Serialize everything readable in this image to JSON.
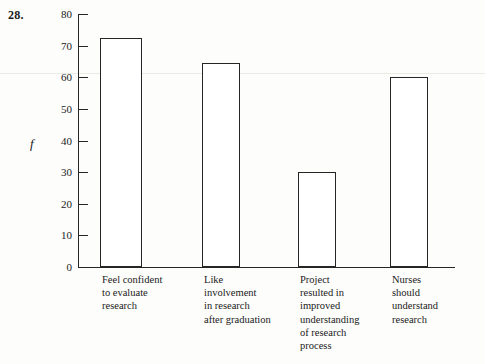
{
  "problem": {
    "number": "28."
  },
  "chart_data": {
    "type": "bar",
    "title": "",
    "xlabel": "",
    "ylabel": "f",
    "ylim": [
      0,
      80
    ],
    "ytick_step": 10,
    "yticks": [
      "80",
      "70",
      "60",
      "50",
      "40",
      "30",
      "20",
      "10",
      "0"
    ],
    "grid": false,
    "legend": null,
    "categories": [
      "Feel confident\nto evaluate\nresearch",
      "Like\ninvolvement\nin research\nafter graduation",
      "Project\nresulted in\nimproved\nunderstanding\nof research\nprocess",
      "Nurses\nshould\nunderstand\nresearch"
    ],
    "values": [
      72.5,
      64.5,
      30,
      60
    ],
    "bar_color": "#ffffff",
    "bar_edge_color": "#262626",
    "axis_color": "#262626"
  }
}
